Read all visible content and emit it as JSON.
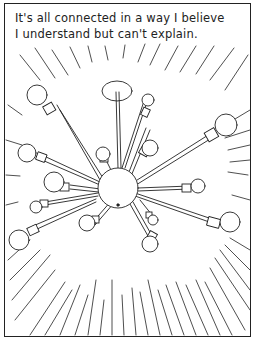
{
  "comic": {
    "caption_lines": [
      "It's all connected in a way I believe",
      "I understand but can't explain."
    ],
    "illustration": "sputnik-chandelier-icon",
    "style": "black ink line art on white",
    "colors": {
      "ink": "#222222",
      "paper": "#ffffff"
    }
  }
}
